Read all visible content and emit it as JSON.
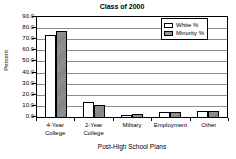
{
  "chart_data": {
    "type": "bar",
    "title": "Class of 2000",
    "xlabel": "Post-High School Plans",
    "ylabel": "Percent",
    "categories": [
      "4-Year College",
      "2-Year College",
      "Military",
      "Employment",
      "Other"
    ],
    "category_lines": [
      "4-Year\nCollege",
      "2-Year\nCollege",
      "Military",
      "Employment",
      "Other"
    ],
    "series": [
      {
        "name": "White %",
        "color": "#ffffff",
        "values": [
          73.5,
          13.5,
          2.0,
          4.5,
          5.5
        ]
      },
      {
        "name": "Minority %",
        "color": "#808080",
        "values": [
          77.0,
          11.0,
          2.5,
          4.5,
          5.0
        ]
      }
    ],
    "ylim": [
      0.0,
      90.0
    ],
    "ytick_values": [
      90.0,
      80.0,
      70.0,
      60.0,
      50.0,
      40.0,
      30.0,
      20.0,
      10.0,
      0.0
    ],
    "ytick_labels": [
      "90.0",
      "80.0",
      "70.0",
      "60.0",
      "50.0",
      "40.0",
      "30.0",
      "20.0",
      "10.0",
      "0.0"
    ],
    "grid": true,
    "legend_position": "top-right"
  },
  "legend": {
    "entries": [
      {
        "label": "White %"
      },
      {
        "label": "Minority %"
      }
    ]
  }
}
